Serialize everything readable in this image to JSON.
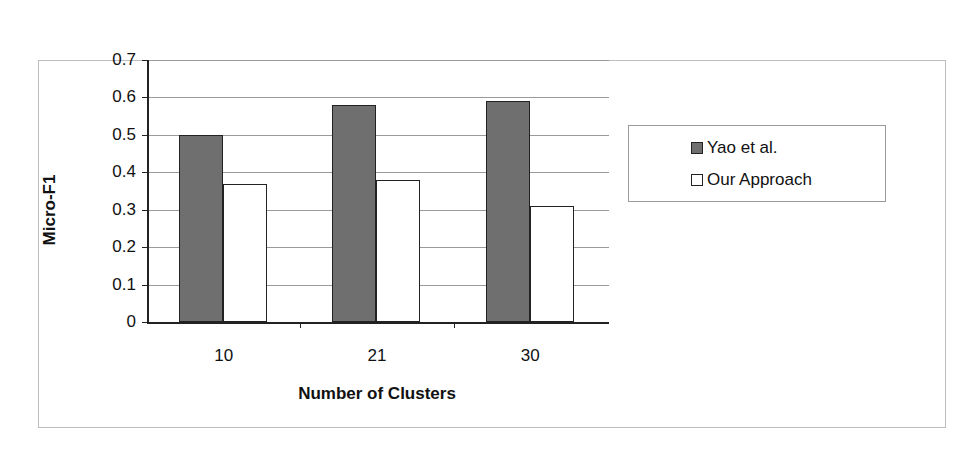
{
  "chart_data": {
    "type": "bar",
    "title": "",
    "xlabel": "Number of Clusters",
    "ylabel": "Micro-F1",
    "categories": [
      "10",
      "21",
      "30"
    ],
    "series": [
      {
        "name": "Yao et al.",
        "color": "#6f6f6f",
        "values": [
          0.5,
          0.58,
          0.59
        ]
      },
      {
        "name": "Our Approach",
        "color": "#ffffff",
        "values": [
          0.37,
          0.38,
          0.31
        ]
      }
    ],
    "ylim": [
      0,
      0.7
    ],
    "yticks": [
      "0",
      "0.1",
      "0.2",
      "0.3",
      "0.4",
      "0.5",
      "0.6",
      "0.7"
    ],
    "grid": true,
    "legend_position": "right"
  }
}
